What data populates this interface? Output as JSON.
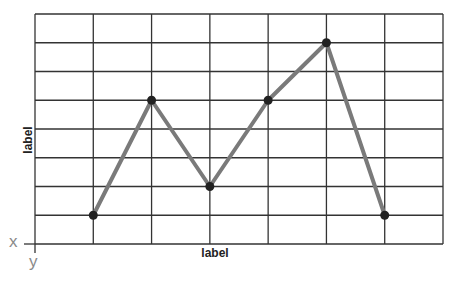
{
  "chart_data": {
    "type": "line",
    "title": "",
    "xlabel": "label",
    "ylabel": "label",
    "axis_letters": {
      "x": "x",
      "y": "y"
    },
    "x": [
      1,
      2,
      3,
      4,
      5,
      6
    ],
    "series": [
      {
        "name": "series",
        "values": [
          1,
          5,
          2,
          5,
          7,
          1
        ]
      }
    ],
    "xlim": [
      0,
      7
    ],
    "ylim": [
      0,
      8
    ],
    "grid": true,
    "legend": false,
    "colors": {
      "line": "#7a7a7a",
      "marker": "#222222",
      "grid": "#333333",
      "axis_letters": "#8a8a8a"
    }
  }
}
